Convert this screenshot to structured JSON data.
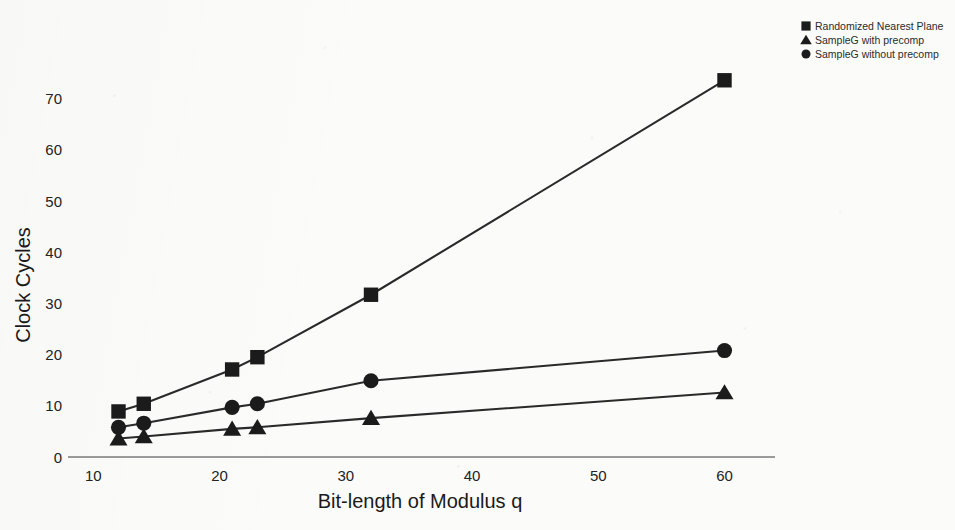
{
  "chart_data": {
    "type": "line",
    "title": "",
    "xlabel": "Bit-length of Modulus q",
    "ylabel": "Clock Cycles",
    "xlim": [
      8,
      64
    ],
    "ylim": [
      0,
      76
    ],
    "xticks": [
      10,
      20,
      30,
      40,
      50,
      60
    ],
    "yticks": [
      0,
      10,
      20,
      30,
      40,
      50,
      60,
      70
    ],
    "xtick_labels": [
      "10",
      "20",
      "30",
      "40",
      "50",
      "60"
    ],
    "ytick_labels": [
      "0",
      "10",
      "20",
      "30",
      "40",
      "50",
      "60",
      "70"
    ],
    "grid": false,
    "legend_position": "top-right",
    "x": [
      12,
      14,
      21,
      23,
      32,
      60
    ],
    "series": [
      {
        "name": "Randomized Nearest Plane",
        "marker": "square",
        "values": [
          8.9,
          10.4,
          17.1,
          19.5,
          31.7,
          73.6
        ]
      },
      {
        "name": "SampleG with precomp",
        "marker": "triangle",
        "values": [
          3.6,
          4.0,
          5.5,
          5.8,
          7.6,
          12.6
        ]
      },
      {
        "name": "SampleG without precomp",
        "marker": "circle",
        "values": [
          5.8,
          6.6,
          9.7,
          10.4,
          14.9,
          20.8
        ]
      }
    ]
  },
  "legend": {
    "items": [
      {
        "label": "Randomized Nearest Plane",
        "marker": "square-marker-icon"
      },
      {
        "label": "SampleG with precomp",
        "marker": "triangle-marker-icon"
      },
      {
        "label": "SampleG without precomp",
        "marker": "circle-marker-icon"
      }
    ]
  },
  "colors": {
    "ink": "#1b1b1b",
    "axis": "#6f6f6f",
    "paper": "#fbfbfa"
  }
}
